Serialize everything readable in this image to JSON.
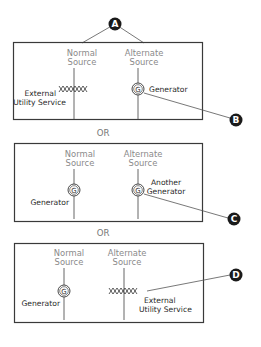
{
  "callouts": {
    "a": "A",
    "b": "B",
    "c": "C",
    "d": "D"
  },
  "separators": [
    "OR",
    "OR"
  ],
  "panels": [
    {
      "normal_label_1": "Normal",
      "normal_label_2": "Source",
      "alternate_label_1": "Alternate",
      "alternate_label_2": "Source",
      "left_device": "utility",
      "left_caption_1": "External",
      "left_caption_2": "Utility Service",
      "right_device": "generator",
      "right_caption_1": "Generator",
      "right_caption_2": ""
    },
    {
      "normal_label_1": "Normal",
      "normal_label_2": "Source",
      "alternate_label_1": "Alternate",
      "alternate_label_2": "Source",
      "left_device": "generator",
      "left_caption_1": "Generator",
      "left_caption_2": "",
      "right_device": "generator",
      "right_caption_1": "Another",
      "right_caption_2": "Generator"
    },
    {
      "normal_label_1": "Normal",
      "normal_label_2": "Source",
      "alternate_label_1": "Alternate",
      "alternate_label_2": "Source",
      "left_device": "generator",
      "left_caption_1": "Generator",
      "left_caption_2": "",
      "right_device": "utility",
      "right_caption_1": "External",
      "right_caption_2": "Utility Service"
    }
  ],
  "generator_symbol": "G",
  "colors": {
    "box_border": "#3a3a3a",
    "line": "#555555",
    "label_grey": "#8a8a8a",
    "label_dark": "#2a2a2a",
    "callout_fill": "#1a1a1a"
  }
}
